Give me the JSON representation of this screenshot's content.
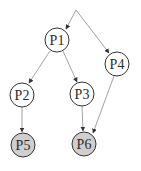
{
  "diagram": {
    "type": "directed-graph",
    "colors": {
      "background": "#ffffff",
      "node_stroke": "#333333",
      "node_fill": "#ffffff",
      "node_fill_highlight": "#cfcfcf",
      "edge": "#8a8a8a",
      "arrowhead": "#333333"
    },
    "nodes": [
      {
        "id": "P1",
        "label": "P1",
        "cx": 57,
        "cy": 40,
        "highlighted": false
      },
      {
        "id": "P2",
        "label": "P2",
        "cx": 22,
        "cy": 95,
        "highlighted": false
      },
      {
        "id": "P3",
        "label": "P3",
        "cx": 82,
        "cy": 94,
        "highlighted": false
      },
      {
        "id": "P4",
        "label": "P4",
        "cx": 117,
        "cy": 64,
        "highlighted": false
      },
      {
        "id": "P5",
        "label": "P5",
        "cx": 23,
        "cy": 145,
        "highlighted": true
      },
      {
        "id": "P6",
        "label": "P6",
        "cx": 84,
        "cy": 144,
        "highlighted": true
      }
    ],
    "edges": [
      {
        "from": "root",
        "to": "P1"
      },
      {
        "from": "root",
        "to": "P4"
      },
      {
        "from": "P1",
        "to": "P2"
      },
      {
        "from": "P1",
        "to": "P3"
      },
      {
        "from": "P2",
        "to": "P5"
      },
      {
        "from": "P3",
        "to": "P6"
      },
      {
        "from": "P4",
        "to": "P6"
      }
    ]
  }
}
